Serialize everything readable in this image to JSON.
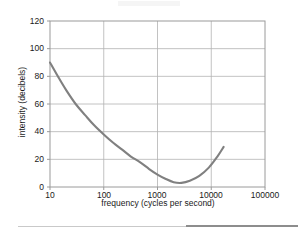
{
  "figure": {
    "caption": "",
    "xlabel": "frequency (cycles per second)",
    "ylabel": "intensity (decibels)"
  },
  "chart_data": {
    "type": "line",
    "title": "",
    "xlabel": "frequency (cycles per second)",
    "ylabel": "intensity (decibels)",
    "xscale": "log",
    "yscale": "linear",
    "xlim": [
      10,
      100000
    ],
    "ylim": [
      0,
      120
    ],
    "xticks": [
      10,
      100,
      1000,
      10000,
      100000
    ],
    "xtick_labels": [
      "10",
      "100",
      "1000",
      "10000",
      "100000"
    ],
    "yticks": [
      0,
      20,
      40,
      60,
      80,
      100,
      120
    ],
    "ytick_labels": [
      "0",
      "20",
      "40",
      "60",
      "80",
      "100",
      "120"
    ],
    "grid": "both",
    "legend": "none",
    "series": [
      {
        "name": "threshold of hearing",
        "color": "#808080",
        "x": [
          10,
          14,
          20,
          30,
          45,
          65,
          100,
          150,
          220,
          320,
          470,
          700,
          1000,
          1400,
          2000,
          2800,
          4000,
          6000,
          9000,
          13000,
          17000
        ],
        "values": [
          90,
          80,
          70,
          60,
          52,
          45,
          38,
          32,
          27,
          22,
          18,
          13,
          9,
          6,
          3.5,
          3,
          4.5,
          8,
          14,
          22,
          29
        ]
      }
    ],
    "annotations": []
  },
  "ticks": {
    "y": [
      "120",
      "100",
      "80",
      "60",
      "40",
      "20",
      "0"
    ],
    "x": [
      "10",
      "100",
      "1000",
      "10000",
      "100000"
    ]
  },
  "colors": {
    "curve": "#808080",
    "grid": "#b3b3b3",
    "frame": "#9a9a9a",
    "text": "#1a1a1a",
    "rule_light": "#c9c9c9",
    "rule_dark": "#8d8d8d"
  }
}
